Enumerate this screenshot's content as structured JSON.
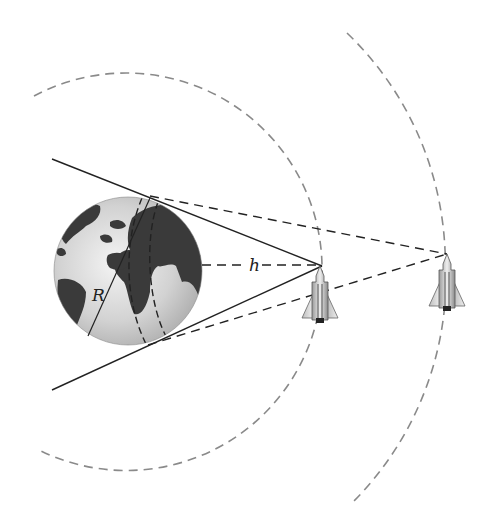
{
  "diagram": {
    "type": "satellite-orbit-coverage",
    "labels": {
      "radius": "R",
      "altitude": "h"
    },
    "elements": {
      "earth": "globe",
      "inner_orbit": "dashed circular orbit (lower altitude)",
      "outer_orbit": "dashed circular orbit (higher altitude)",
      "satellite_low": "spacecraft at inner orbit",
      "satellite_high": "spacecraft at outer orbit",
      "tangent_lines_low": "solid lines from low satellite tangent to Earth",
      "tangent_lines_high": "dashed lines from high satellite tangent to Earth"
    },
    "colors": {
      "line": "#222222",
      "orbit": "#888888",
      "ocean": "#d9d9d9",
      "land": "#3a3a3a"
    }
  }
}
